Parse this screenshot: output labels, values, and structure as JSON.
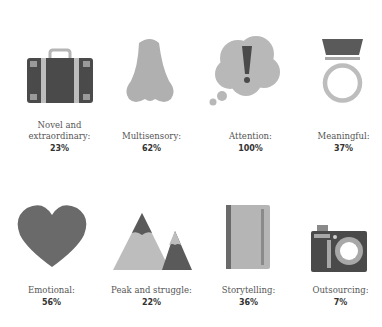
{
  "items": [
    {
      "label": "Novel and extraordinary:",
      "label_line1": "Novel and",
      "label_line2": "extraordinary:",
      "value": "23%",
      "icon": "suitcase-icon"
    },
    {
      "label": "Multisensory:",
      "value": "62%",
      "icon": "nose-icon"
    },
    {
      "label": "Attention:",
      "value": "100%",
      "icon": "thought-bubble-exclamation-icon"
    },
    {
      "label": "Meaningful:",
      "value": "37%",
      "icon": "ring-icon"
    },
    {
      "label": "Emotional:",
      "value": "56%",
      "icon": "heart-icon"
    },
    {
      "label": "Peak and struggle:",
      "value": "22%",
      "icon": "mountains-icon"
    },
    {
      "label": "Storytelling:",
      "value": "36%",
      "icon": "book-icon"
    },
    {
      "label": "Outsourcing:",
      "value": "7%",
      "icon": "camera-icon"
    }
  ],
  "colors": {
    "dark": "#4a4a4a",
    "mid": "#8a8a8a",
    "light": "#b5b5b5",
    "pale": "#cfcfcf"
  }
}
